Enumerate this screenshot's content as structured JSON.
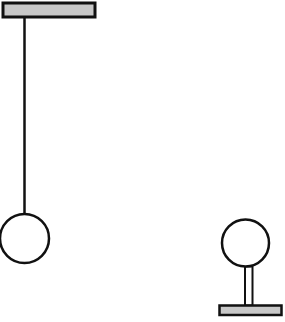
{
  "diagram": {
    "colors": {
      "stroke": "#111111",
      "bar_fill": "#c8c8c8",
      "bob_fill": "#ffffff",
      "background": "#ffffff"
    },
    "pendulum": {
      "support_bar": {
        "x": 3,
        "y": 3,
        "width": 92,
        "height": 14
      },
      "rod": {
        "x": 24.5,
        "y1": 17,
        "y2": 213
      },
      "bob": {
        "cx": 24.5,
        "cy": 238.5,
        "r": 24.5
      }
    },
    "stand": {
      "bob": {
        "cx": 245.5,
        "cy": 243,
        "r": 23.5
      },
      "post": {
        "x": 245,
        "y": 266.5,
        "width": 7.5,
        "height": 39
      },
      "base": {
        "x": 219.5,
        "y": 305.5,
        "width": 62,
        "height": 9.5
      }
    }
  }
}
